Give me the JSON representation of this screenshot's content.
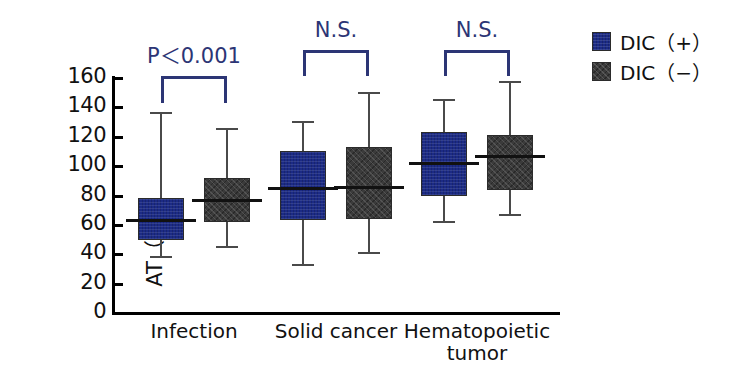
{
  "chart_data": {
    "type": "box",
    "title": "",
    "xlabel": "",
    "ylabel": "AT（%）",
    "ylim": [
      0,
      160
    ],
    "ytick_step": 20,
    "yticks": [
      "160",
      "140",
      "120",
      "100",
      "80",
      "60",
      "40",
      "20",
      "0"
    ],
    "grid": false,
    "legend_position": "right",
    "categories": [
      "Infection",
      "Solid cancer",
      "Hematopoietic tumor"
    ],
    "category_labels": [
      {
        "line1": "Infection",
        "line2": ""
      },
      {
        "line1": "Solid cancer",
        "line2": ""
      },
      {
        "line1": "Hematopoietic",
        "line2": "tumor"
      }
    ],
    "series": [
      {
        "name": "DIC（+）",
        "color": "#1c2b86",
        "boxes": [
          {
            "category": "Infection",
            "min": 38,
            "q1": 50,
            "median": 63,
            "q3": 78,
            "max": 136
          },
          {
            "category": "Solid cancer",
            "min": 33,
            "q1": 63,
            "median": 85,
            "q3": 110,
            "max": 130
          },
          {
            "category": "Hematopoietic tumor",
            "min": 62,
            "q1": 80,
            "median": 102,
            "q3": 123,
            "max": 145
          }
        ]
      },
      {
        "name": "DIC（−）",
        "color": "#3b3b3b",
        "boxes": [
          {
            "category": "Infection",
            "min": 45,
            "q1": 62,
            "median": 77,
            "q3": 92,
            "max": 125
          },
          {
            "category": "Solid cancer",
            "min": 41,
            "q1": 64,
            "median": 86,
            "q3": 113,
            "max": 150
          },
          {
            "category": "Hematopoietic tumor",
            "min": 67,
            "q1": 84,
            "median": 107,
            "q3": 121,
            "max": 157
          }
        ]
      }
    ],
    "annotations": [
      {
        "category": "Infection",
        "text": "P＜0.001",
        "color": "#2c3575"
      },
      {
        "category": "Solid cancer",
        "text": "N.S.",
        "color": "#2c3575"
      },
      {
        "category": "Hematopoietic tumor",
        "text": "N.S.",
        "color": "#2c3575"
      }
    ]
  },
  "legend": {
    "items": [
      {
        "label": "DIC（+）",
        "swatch": "dic-pos"
      },
      {
        "label": "DIC（−）",
        "swatch": "dic-neg"
      }
    ]
  }
}
